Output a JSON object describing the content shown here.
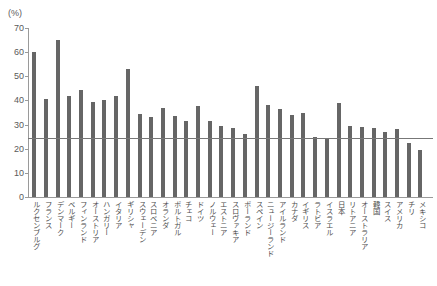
{
  "chart_data": {
    "type": "bar",
    "title": "",
    "subtitle": "",
    "xlabel": "",
    "ylabel": "",
    "unit_label": "(%)",
    "ylim": [
      0,
      70
    ],
    "yticks": [
      0,
      10,
      20,
      30,
      40,
      50,
      60,
      70
    ],
    "ytick_labels": [
      "0",
      "10",
      "20",
      "30",
      "40",
      "50",
      "60",
      "70"
    ],
    "grid": false,
    "legend": null,
    "bar_color": "#666666",
    "reference_line": {
      "value": 24.5,
      "label": "",
      "color": "#777777"
    },
    "categories": [
      "ルクセンブルグ",
      "フランス",
      "デンマーク",
      "ベルギー",
      "フィンランド",
      "オーストリア",
      "ハンガリー",
      "イタリア",
      "ギリシャ",
      "スウェーデン",
      "スロベニア",
      "オランダ",
      "ポルトガル",
      "チェコ",
      "ドイツ",
      "ノルウェー",
      "エストニア",
      "スロヴァキア",
      "ポーランド",
      "スペイン",
      "ニュージーランド",
      "アイルランド",
      "カナダ",
      "イギリス",
      "ラトビア",
      "イスラエル",
      "日本",
      "リトアニア",
      "オーストラリア",
      "韓国",
      "スイス",
      "アメリカ",
      "チリ",
      "メキシコ"
    ],
    "values": [
      60,
      40.5,
      65,
      42,
      44.5,
      39.5,
      40,
      42,
      53,
      34.5,
      33,
      37,
      33.5,
      31.5,
      37.5,
      31.5,
      29.5,
      28.5,
      26,
      46,
      38,
      36.5,
      34,
      35,
      25,
      24,
      39,
      29.5,
      29,
      28.5,
      27,
      28,
      22.5,
      19.5
    ]
  }
}
